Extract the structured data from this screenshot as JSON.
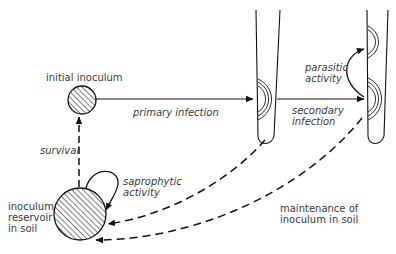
{
  "diagram": {
    "nodes": {
      "initial_inoculum": "initial inoculum",
      "reservoir_line1": "inoculum",
      "reservoir_line2": "reservoir",
      "reservoir_line3": "in soil"
    },
    "edges": {
      "primary_infection": "primary infection",
      "survival": "survival",
      "saprophytic_line1": "saprophytic",
      "saprophytic_line2": "activity",
      "parasitic_line1": "parasitic",
      "parasitic_line2": "activity",
      "secondary_line1": "secondary",
      "secondary_line2": "infection",
      "maintenance_line1": "maintenance of",
      "maintenance_line2": "inoculum in soil"
    },
    "colors": {
      "line": "#111111",
      "text": "#3a3a3a",
      "background": "#ffffff"
    }
  }
}
